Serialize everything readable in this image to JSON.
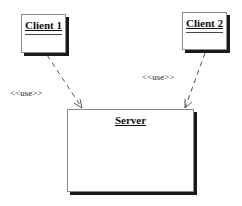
{
  "diagram": {
    "type": "uml-class-dependency",
    "nodes": [
      {
        "id": "client1",
        "label": "Client 1"
      },
      {
        "id": "client2",
        "label": "Client 2"
      },
      {
        "id": "server",
        "label": "Server"
      }
    ],
    "edges": [
      {
        "from": "client1",
        "to": "server",
        "label": "<<use>>",
        "style": "dashed-arrow"
      },
      {
        "from": "client2",
        "to": "server",
        "label": "<<use>>",
        "style": "dashed-arrow"
      }
    ]
  },
  "colors": {
    "border": "#8a8a8a",
    "shadow": "#1a1a1a",
    "line": "#555555",
    "text": "#111111"
  }
}
